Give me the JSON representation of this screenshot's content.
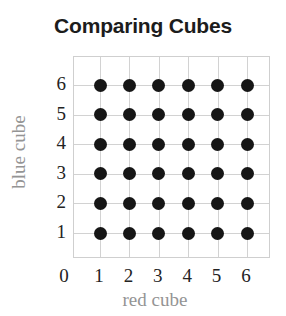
{
  "chart_data": {
    "type": "scatter",
    "title": "Comparing Cubes",
    "xlabel": "red cube",
    "ylabel": "blue cube",
    "xtick_labels": [
      "0",
      "1",
      "2",
      "3",
      "4",
      "5",
      "6"
    ],
    "ytick_labels": [
      "1",
      "2",
      "3",
      "4",
      "5",
      "6"
    ],
    "xlim": [
      0,
      6
    ],
    "ylim": [
      0,
      6
    ],
    "grid": true,
    "legend": "none",
    "marker": "filled-circle",
    "marker_color": "#161616",
    "marker_size_px": 13,
    "grid_color": "#d2d2d2",
    "axis_label_color": "#949494",
    "tick_label_color": "#232323",
    "title_color": "#1c1c1c",
    "point_count": 36,
    "points": [
      {
        "x": 1,
        "y": 1
      },
      {
        "x": 2,
        "y": 1
      },
      {
        "x": 3,
        "y": 1
      },
      {
        "x": 4,
        "y": 1
      },
      {
        "x": 5,
        "y": 1
      },
      {
        "x": 6,
        "y": 1
      },
      {
        "x": 1,
        "y": 2
      },
      {
        "x": 2,
        "y": 2
      },
      {
        "x": 3,
        "y": 2
      },
      {
        "x": 4,
        "y": 2
      },
      {
        "x": 5,
        "y": 2
      },
      {
        "x": 6,
        "y": 2
      },
      {
        "x": 1,
        "y": 3
      },
      {
        "x": 2,
        "y": 3
      },
      {
        "x": 3,
        "y": 3
      },
      {
        "x": 4,
        "y": 3
      },
      {
        "x": 5,
        "y": 3
      },
      {
        "x": 6,
        "y": 3
      },
      {
        "x": 1,
        "y": 4
      },
      {
        "x": 2,
        "y": 4
      },
      {
        "x": 3,
        "y": 4
      },
      {
        "x": 4,
        "y": 4
      },
      {
        "x": 5,
        "y": 4
      },
      {
        "x": 6,
        "y": 4
      },
      {
        "x": 1,
        "y": 5
      },
      {
        "x": 2,
        "y": 5
      },
      {
        "x": 3,
        "y": 5
      },
      {
        "x": 4,
        "y": 5
      },
      {
        "x": 5,
        "y": 5
      },
      {
        "x": 6,
        "y": 5
      },
      {
        "x": 1,
        "y": 6
      },
      {
        "x": 2,
        "y": 6
      },
      {
        "x": 3,
        "y": 6
      },
      {
        "x": 4,
        "y": 6
      },
      {
        "x": 5,
        "y": 6
      },
      {
        "x": 6,
        "y": 6
      }
    ]
  }
}
